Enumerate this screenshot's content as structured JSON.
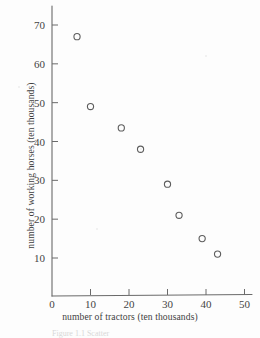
{
  "figure": {
    "background_color": "#fdfdfd",
    "ink_color": "#5d5d5d",
    "caption_partial": "Figure 1.1  Scatter"
  },
  "chart_data": {
    "type": "scatter",
    "title": "",
    "xlabel": "number of tractors (ten thousands)",
    "ylabel": "number of working horses (ten thousands)",
    "xlim": [
      0,
      55
    ],
    "ylim": [
      0,
      75
    ],
    "xticks": [
      0,
      10,
      20,
      30,
      40,
      50
    ],
    "xtick_labels": [
      "0",
      "10",
      "20",
      "30",
      "40",
      "50"
    ],
    "yticks": [
      10,
      20,
      30,
      40,
      50,
      60,
      70
    ],
    "ytick_labels": [
      "10",
      "20",
      "30",
      "40",
      "50",
      "60",
      "70"
    ],
    "grid": false,
    "legend": false,
    "marker": "open-circle",
    "x": [
      6.5,
      10,
      18,
      23,
      30,
      33,
      39,
      43
    ],
    "y": [
      67,
      49,
      43.5,
      38,
      29,
      21,
      15,
      11
    ],
    "points": [
      {
        "x": 6.5,
        "y": 67
      },
      {
        "x": 10,
        "y": 49
      },
      {
        "x": 18,
        "y": 43.5
      },
      {
        "x": 23,
        "y": 38
      },
      {
        "x": 30,
        "y": 29
      },
      {
        "x": 33,
        "y": 21
      },
      {
        "x": 39,
        "y": 15
      },
      {
        "x": 43,
        "y": 11
      }
    ]
  }
}
